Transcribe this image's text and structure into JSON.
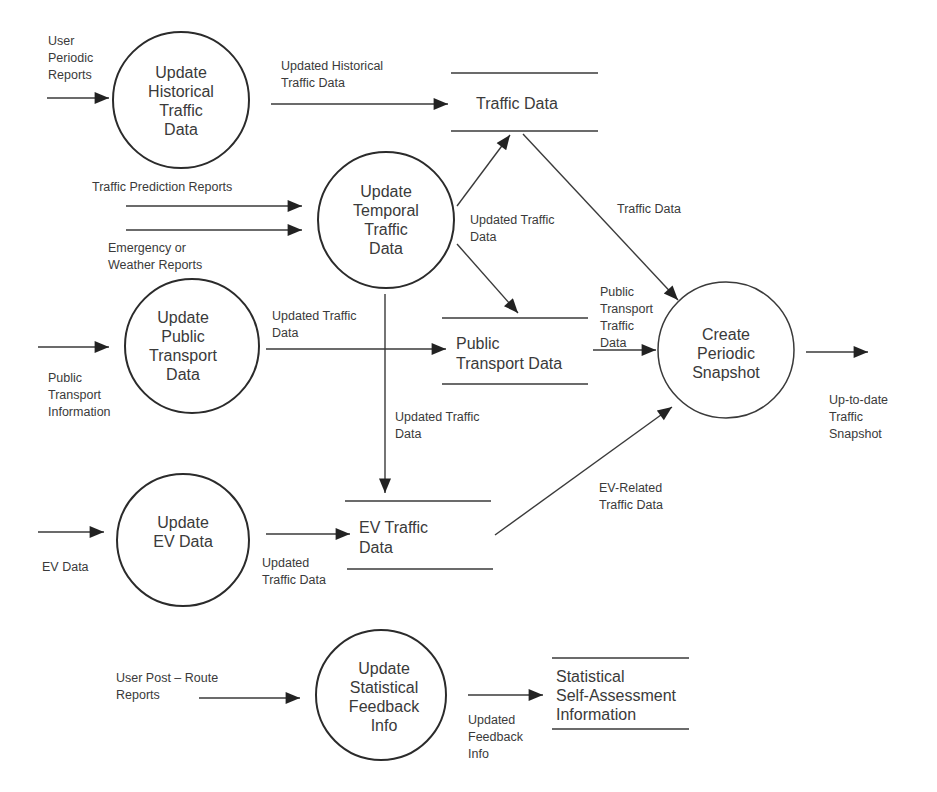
{
  "diagram": {
    "type": "data-flow-diagram",
    "processes": [
      {
        "id": "p_hist",
        "lines": [
          "Update",
          "Historical",
          "Traffic",
          "Data"
        ]
      },
      {
        "id": "p_temp",
        "lines": [
          "Update",
          "Temporal",
          "Traffic",
          "Data"
        ]
      },
      {
        "id": "p_pub",
        "lines": [
          "Update",
          "Public",
          "Transport",
          "Data"
        ]
      },
      {
        "id": "p_ev",
        "lines": [
          "Update",
          "EV Data"
        ]
      },
      {
        "id": "p_stat",
        "lines": [
          "Update",
          "Statistical",
          "Feedback",
          "Info"
        ]
      },
      {
        "id": "p_snap",
        "lines": [
          "Create",
          "Periodic",
          "Snapshot"
        ]
      }
    ],
    "stores": [
      {
        "id": "s_traffic",
        "lines": [
          "Traffic Data"
        ]
      },
      {
        "id": "s_pub",
        "lines": [
          "Public",
          "Transport Data"
        ]
      },
      {
        "id": "s_ev",
        "lines": [
          "EV Traffic",
          "Data"
        ]
      },
      {
        "id": "s_stat",
        "lines": [
          "Statistical",
          "Self-Assessment",
          "Information"
        ]
      }
    ],
    "flows": [
      {
        "id": "f_user_periodic",
        "lines": [
          "User",
          "Periodic",
          "Reports"
        ]
      },
      {
        "id": "f_upd_hist",
        "lines": [
          "Updated Historical",
          "Traffic Data"
        ]
      },
      {
        "id": "f_pred",
        "lines": [
          "Traffic Prediction Reports"
        ]
      },
      {
        "id": "f_emerg",
        "lines": [
          "Emergency or",
          "Weather Reports"
        ]
      },
      {
        "id": "f_temp_up",
        "lines": [
          "Updated Traffic",
          "Data"
        ]
      },
      {
        "id": "f_traffic_snap",
        "lines": [
          "Traffic Data"
        ]
      },
      {
        "id": "f_pub_upd",
        "lines": [
          "Updated Traffic",
          "Data"
        ]
      },
      {
        "id": "f_pub_info",
        "lines": [
          "Public",
          "Transport",
          "Information"
        ]
      },
      {
        "id": "f_pub_snap",
        "lines": [
          "Public",
          "Transport",
          "Traffic",
          "Data"
        ]
      },
      {
        "id": "f_temp_ev",
        "lines": [
          "Updated Traffic",
          "Data"
        ]
      },
      {
        "id": "f_ev_data",
        "lines": [
          "EV Data"
        ]
      },
      {
        "id": "f_ev_upd",
        "lines": [
          "Updated",
          "Traffic Data"
        ]
      },
      {
        "id": "f_ev_related",
        "lines": [
          "EV-Related",
          "Traffic Data"
        ]
      },
      {
        "id": "f_snapshot_out",
        "lines": [
          "Up-to-date",
          "Traffic",
          "Snapshot"
        ]
      },
      {
        "id": "f_user_post",
        "lines": [
          "User Post – Route",
          "Reports"
        ]
      },
      {
        "id": "f_feedback",
        "lines": [
          "Updated",
          "Feedback",
          "Info"
        ]
      }
    ]
  }
}
